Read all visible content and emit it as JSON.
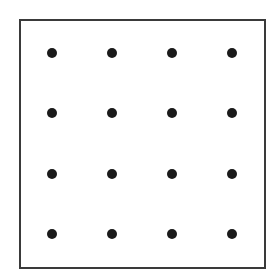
{
  "diagram": {
    "type": "dot-grid",
    "rows": 4,
    "cols": 4,
    "frame": {
      "left": 19,
      "top": 19,
      "width": 243,
      "height": 246,
      "border_color": "#3a3a3a"
    },
    "dot_color": "#1a1a1a",
    "dot_diameter": 10,
    "dots": [
      {
        "row": 0,
        "col": 0,
        "x": 52,
        "y": 53
      },
      {
        "row": 0,
        "col": 1,
        "x": 112,
        "y": 53
      },
      {
        "row": 0,
        "col": 2,
        "x": 172,
        "y": 53
      },
      {
        "row": 0,
        "col": 3,
        "x": 232,
        "y": 53
      },
      {
        "row": 1,
        "col": 0,
        "x": 52,
        "y": 113
      },
      {
        "row": 1,
        "col": 1,
        "x": 112,
        "y": 113
      },
      {
        "row": 1,
        "col": 2,
        "x": 172,
        "y": 113
      },
      {
        "row": 1,
        "col": 3,
        "x": 232,
        "y": 113
      },
      {
        "row": 2,
        "col": 0,
        "x": 52,
        "y": 174
      },
      {
        "row": 2,
        "col": 1,
        "x": 112,
        "y": 174
      },
      {
        "row": 2,
        "col": 2,
        "x": 172,
        "y": 174
      },
      {
        "row": 2,
        "col": 3,
        "x": 232,
        "y": 174
      },
      {
        "row": 3,
        "col": 0,
        "x": 52,
        "y": 234
      },
      {
        "row": 3,
        "col": 1,
        "x": 112,
        "y": 234
      },
      {
        "row": 3,
        "col": 2,
        "x": 172,
        "y": 234
      },
      {
        "row": 3,
        "col": 3,
        "x": 232,
        "y": 234
      }
    ]
  }
}
